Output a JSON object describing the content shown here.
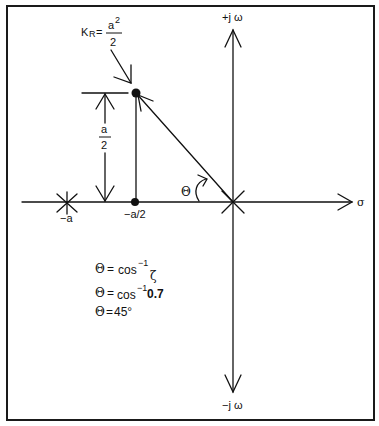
{
  "diagram": {
    "axes": {
      "imag_pos_label": "+j ω",
      "imag_neg_label": "−j ω",
      "real_label": "σ"
    },
    "poles": {
      "open_loop_a_label": "−a",
      "open_loop_origin": "origin",
      "breakaway_label": "−a/2"
    },
    "gain": {
      "prefix": "K",
      "subscript": "R",
      "equals": "=",
      "numerator": "a",
      "numerator_exp": "2",
      "denominator": "2"
    },
    "dimension": {
      "numerator": "a",
      "denominator": "2"
    },
    "angle_symbol": "Θ",
    "equations": [
      {
        "lhs": "Θ",
        "eq": "=",
        "rhs": "cos",
        "exp": "−1",
        "arg": "ζ"
      },
      {
        "lhs": "Θ",
        "eq": "=",
        "rhs": "cos",
        "exp": "−1",
        "arg": "0.7"
      },
      {
        "lhs": "Θ",
        "eq": "=",
        "rhs": "45°",
        "exp": "",
        "arg": ""
      }
    ],
    "colors": {
      "line": "#111111",
      "background": "#ffffff"
    }
  }
}
